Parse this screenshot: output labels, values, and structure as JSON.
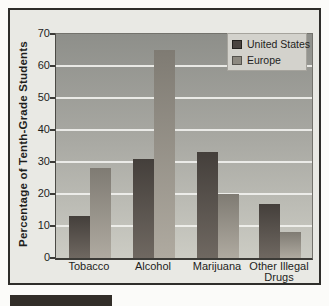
{
  "figure": {
    "palette": {
      "page_background": "#fbfbf9",
      "figure_background": "#e9e9e4",
      "figure_border": "#2f2e2b",
      "plot_gradient_top": "#8e8f8a",
      "plot_gradient_bottom": "#ccccc4",
      "gridline": "#f2f2ee",
      "text": "#1e1e1c",
      "caption_box": "#322e29",
      "legend_background": "#d3d2cc"
    }
  },
  "chart_data": {
    "type": "bar",
    "title": "",
    "categories": [
      "Tobacco",
      "Alcohol",
      "Marijuana",
      "Other Illegal Drugs"
    ],
    "series": [
      {
        "name": "United States",
        "values": [
          13,
          31,
          33,
          17
        ],
        "color_top": "#443f3b",
        "color_bottom": "#6f6861",
        "swatch": "#4a4440",
        "swatch_border": "#23211e"
      },
      {
        "name": "Europe",
        "values": [
          28,
          65,
          20,
          8
        ],
        "color_top": "#7f7b73",
        "color_bottom": "#afaaa0",
        "swatch": "#8d8980",
        "swatch_border": "#55534d"
      }
    ],
    "xlabel": "",
    "ylabel": "Percentage of Tenth-Grade Students",
    "ylim": [
      0,
      70
    ],
    "yticks": [
      0,
      10,
      20,
      30,
      40,
      50,
      60,
      70
    ],
    "grid": true,
    "legend_position": "top-right"
  }
}
